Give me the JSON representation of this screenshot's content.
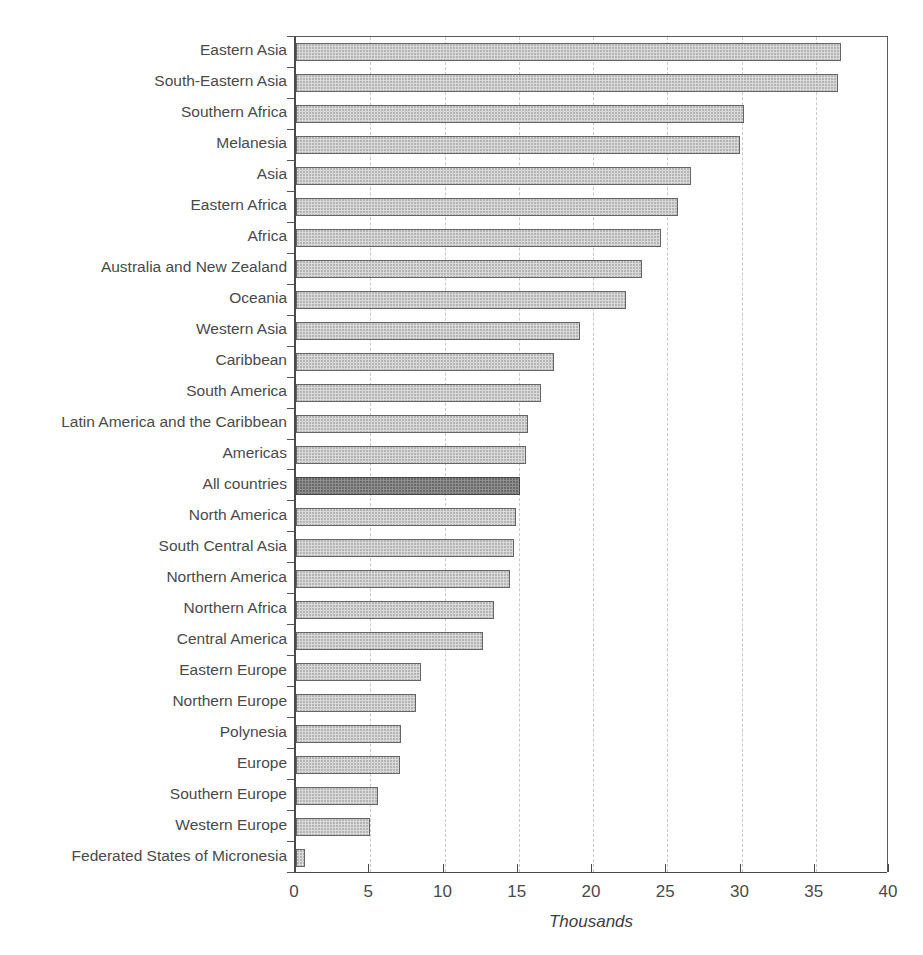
{
  "figure": {
    "title_partial": "",
    "background": "#ffffff"
  },
  "axis": {
    "x_title": "Thousands",
    "x_ticks": [
      "0",
      "5",
      "10",
      "15",
      "20",
      "25",
      "30",
      "35",
      "40"
    ],
    "x_min": 0,
    "x_max": 40,
    "x_tick_step": 5
  },
  "colors": {
    "bar_fill": "#d9d9d9",
    "bar_border": "#666666",
    "highlight_fill": "#8e8e8e",
    "highlight_border": "#4a4a4a",
    "gridline": "#c8c8c8",
    "axis": "#4a4a4a",
    "text": "#4a4a4a"
  },
  "chart_data": {
    "type": "bar",
    "orientation": "horizontal",
    "title": "",
    "xlabel": "Thousands",
    "ylabel": "",
    "xlim": [
      0,
      40
    ],
    "xticks": [
      0,
      5,
      10,
      15,
      20,
      25,
      30,
      35,
      40
    ],
    "grid": "vertical-dashed",
    "legend": "none",
    "highlight_category": "All countries",
    "categories": [
      "Eastern Asia",
      "South-Eastern Asia",
      "Southern Africa",
      "Melanesia",
      "Asia",
      "Eastern Africa",
      "Africa",
      "Australia and New Zealand",
      "Oceania",
      "Western Asia",
      "Caribbean",
      "South America",
      "Latin America and the Caribbean",
      "Americas",
      "All countries",
      "North America",
      "South Central Asia",
      "Northern America",
      "Northern Africa",
      "Central America",
      "Eastern Europe",
      "Northern Europe",
      "Polynesia",
      "Europe",
      "Southern Europe",
      "Western Europe",
      "Federated States of Micronesia"
    ],
    "values": [
      36.7,
      36.5,
      30.2,
      29.9,
      26.6,
      25.7,
      24.6,
      23.3,
      22.2,
      19.1,
      17.4,
      16.5,
      15.6,
      15.5,
      15.1,
      14.8,
      14.7,
      14.4,
      13.3,
      12.6,
      8.4,
      8.1,
      7.1,
      7.0,
      5.5,
      5.0,
      0.6
    ]
  }
}
